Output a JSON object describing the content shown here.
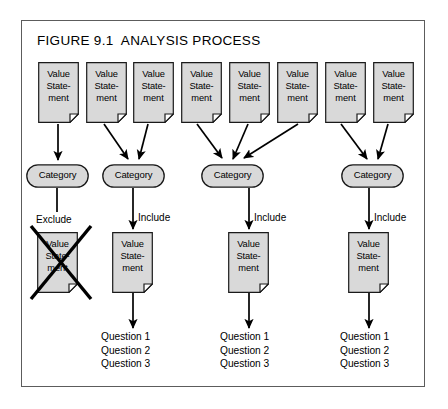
{
  "figure": {
    "title": "FIGURE 9.1  ANALYSIS PROCESS",
    "frame_color": "#5c5c5c",
    "node_fill": "#d9d9d9",
    "node_stroke": "#1a1a1a",
    "background": "#ffffff"
  },
  "value_statements_top": [
    {
      "id": "vs1",
      "line1": "Value",
      "line2": "State-",
      "line3": "ment"
    },
    {
      "id": "vs2",
      "line1": "Value",
      "line2": "State-",
      "line3": "ment"
    },
    {
      "id": "vs3",
      "line1": "Value",
      "line2": "State-",
      "line3": "ment"
    },
    {
      "id": "vs4",
      "line1": "Value",
      "line2": "State-",
      "line3": "ment"
    },
    {
      "id": "vs5",
      "line1": "Value",
      "line2": "State-",
      "line3": "ment"
    },
    {
      "id": "vs6",
      "line1": "Value",
      "line2": "State-",
      "line3": "ment"
    },
    {
      "id": "vs7",
      "line1": "Value",
      "line2": "State-",
      "line3": "ment"
    },
    {
      "id": "vs8",
      "line1": "Value",
      "line2": "State-",
      "line3": "ment"
    }
  ],
  "categories": [
    {
      "id": "cat1",
      "label": "Category"
    },
    {
      "id": "cat2",
      "label": "Category"
    },
    {
      "id": "cat3",
      "label": "Category"
    },
    {
      "id": "cat4",
      "label": "Category"
    }
  ],
  "branch_labels": {
    "exclude": "Exclude",
    "include_1": "Include",
    "include_2": "Include",
    "include_3": "Include"
  },
  "excluded_statement": {
    "line1": "Value",
    "line2": "State-",
    "line3": "ment"
  },
  "included_statements": [
    {
      "id": "inc1",
      "line1": "Value",
      "line2": "State-",
      "line3": "ment"
    },
    {
      "id": "inc2",
      "line1": "Value",
      "line2": "State-",
      "line3": "ment"
    },
    {
      "id": "inc3",
      "line1": "Value",
      "line2": "State-",
      "line3": "ment"
    }
  ],
  "question_groups": [
    {
      "id": "qg1",
      "q1": "Question 1",
      "q2": "Question 2",
      "q3": "Question 3"
    },
    {
      "id": "qg2",
      "q1": "Question 1",
      "q2": "Question 2",
      "q3": "Question 3"
    },
    {
      "id": "qg3",
      "q1": "Question 1",
      "q2": "Question 2",
      "q3": "Question 3"
    }
  ]
}
